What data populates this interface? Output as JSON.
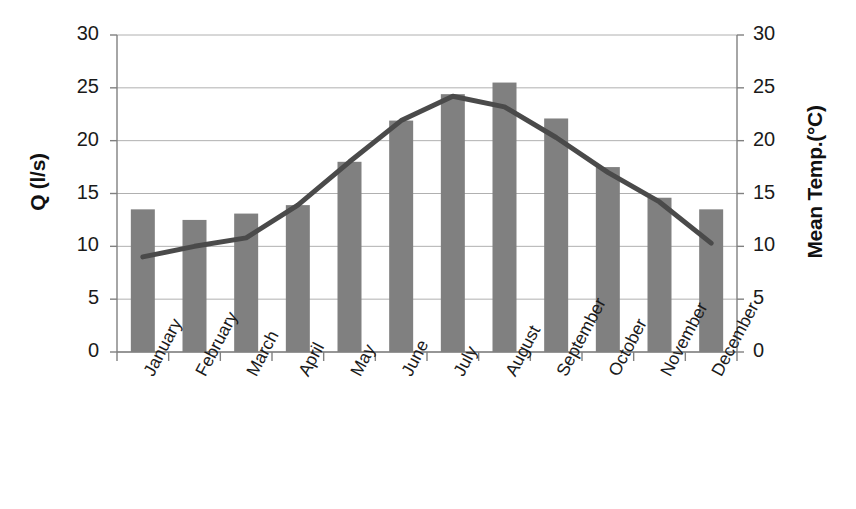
{
  "chart_data": {
    "type": "bar",
    "title": "",
    "xlabel": "",
    "ylabel": "Q (l/s)",
    "y2label": "Mean Temp.(°C)",
    "ylim": [
      0,
      30
    ],
    "y2lim": [
      0,
      30
    ],
    "yticks": [
      0,
      5,
      10,
      15,
      20,
      25,
      30
    ],
    "y2ticks": [
      0,
      5,
      10,
      15,
      20,
      25,
      30
    ],
    "ytick_labels": [
      "0",
      "5",
      "10",
      "15",
      "20",
      "25",
      "30"
    ],
    "y2tick_labels": [
      "0",
      "5",
      "10",
      "15",
      "20",
      "25",
      "30"
    ],
    "grid": true,
    "legend": "none",
    "categories": [
      "January",
      "February",
      "March",
      "April",
      "May",
      "June",
      "July",
      "August",
      "September",
      "October",
      "November",
      "December"
    ],
    "series": [
      {
        "name": "Q (l/s)",
        "type": "bar",
        "axis": "left",
        "color": "#808080",
        "values": [
          13.5,
          12.5,
          13.1,
          13.9,
          18.0,
          21.9,
          24.4,
          25.5,
          22.1,
          17.5,
          14.6,
          13.5
        ]
      },
      {
        "name": "Mean Temp.(°C)",
        "type": "line",
        "axis": "right",
        "color": "#4a4a4a",
        "values": [
          9.0,
          10.0,
          10.8,
          13.9,
          18.0,
          21.9,
          24.2,
          23.2,
          20.3,
          17.0,
          14.2,
          10.3
        ]
      }
    ],
    "colors": {
      "bar": "#808080",
      "line": "#4a4a4a",
      "grid": "#b0b0b0",
      "axis": "#808080",
      "text": "#1a1a1a"
    }
  }
}
